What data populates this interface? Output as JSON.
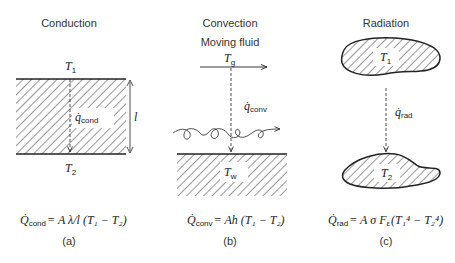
{
  "panels": [
    {
      "id": "a",
      "title": "Conduction",
      "top_label": "T",
      "top_sub": "1",
      "bottom_label": "T",
      "bottom_sub": "2",
      "flux_label": "q̇",
      "flux_sub": "cond",
      "thickness_label": "l",
      "equation": {
        "lhs": "Q̇",
        "lhs_sub": "cond",
        "rhs": "= A λ/l (T₁ − T₂)"
      },
      "caption": "(a)"
    },
    {
      "id": "b",
      "title": "Convection",
      "subtitle": "Moving fluid",
      "gas_label": "T",
      "gas_sub": "g",
      "flux_label": "q̇",
      "flux_sub": "conv",
      "wall_label": "T",
      "wall_sub": "w",
      "equation": {
        "lhs": "Q̇",
        "lhs_sub": "conv",
        "rhs": "= Ah (T₁ − T₂)"
      },
      "caption": "(b)"
    },
    {
      "id": "c",
      "title": "Radiation",
      "top_label": "T",
      "top_sub": "1",
      "bottom_label": "T",
      "bottom_sub": "2",
      "flux_label": "q̇",
      "flux_sub": "rad",
      "equation": {
        "lhs": "Q̇",
        "lhs_sub": "rad",
        "rhs": "= A σ F",
        "rhs_sub": "ε",
        "rhs_tail": "ε (T₁⁴ − T₂⁴)"
      },
      "caption": "(c)"
    }
  ],
  "colors": {
    "line": "#222222",
    "hatch": "#333333",
    "background": "#ffffff"
  }
}
